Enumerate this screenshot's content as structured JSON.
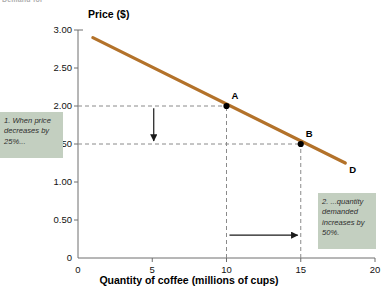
{
  "figure": {
    "cut_off_heading": "Demand for",
    "y_axis_title": "Price ($)",
    "x_axis_title": "Quantity of coffee (millions of cups)"
  },
  "annotations": {
    "callout_1": "1. When price decreases by 25%...",
    "callout_2": "2. ...quantity demanded increases by 50%."
  },
  "colors": {
    "demand_curve": "#b3722a",
    "callout_background": "#c3cfc0",
    "axis": "#6e6e6e",
    "guide_line": "#8a8a8a"
  },
  "chart_data": {
    "type": "line",
    "title": "",
    "xlabel": "Quantity of coffee (millions of cups)",
    "ylabel": "Price ($)",
    "xlim": [
      0,
      20
    ],
    "ylim": [
      0,
      3.0
    ],
    "xticks": [
      "0",
      "5",
      "10",
      "15",
      "20"
    ],
    "xtick_values": [
      0,
      5,
      10,
      15,
      20
    ],
    "yticks": [
      "0",
      "0.50",
      "1.00",
      "1.50",
      "2.00",
      "2.50",
      "3.00"
    ],
    "ytick_values": [
      0,
      0.5,
      1.0,
      1.5,
      2.0,
      2.5,
      3.0
    ],
    "grid": false,
    "legend": null,
    "series": [
      {
        "name": "D",
        "label": "D",
        "color": "#b3722a",
        "x": [
          1.0,
          18.0
        ],
        "y": [
          2.9,
          1.25
        ]
      }
    ],
    "points": [
      {
        "label": "A",
        "x": 10,
        "y": 2.0
      },
      {
        "label": "B",
        "x": 15,
        "y": 1.5
      }
    ],
    "guide_lines": [
      {
        "type": "horizontal",
        "y": 2.0,
        "from_x": 0,
        "to_x": 10
      },
      {
        "type": "horizontal",
        "y": 1.5,
        "from_x": 0,
        "to_x": 15
      },
      {
        "type": "vertical",
        "x": 10,
        "from_y": 0,
        "to_y": 2.0
      },
      {
        "type": "vertical",
        "x": 15,
        "from_y": 0,
        "to_y": 1.5
      }
    ],
    "arrows": [
      {
        "name": "price-decrease-arrow",
        "direction": "down",
        "x": 5.1,
        "from_y": 1.97,
        "to_y": 1.54
      },
      {
        "name": "quantity-increase-arrow",
        "direction": "right",
        "y": 0.3,
        "from_x": 10.2,
        "to_x": 14.8
      }
    ]
  }
}
